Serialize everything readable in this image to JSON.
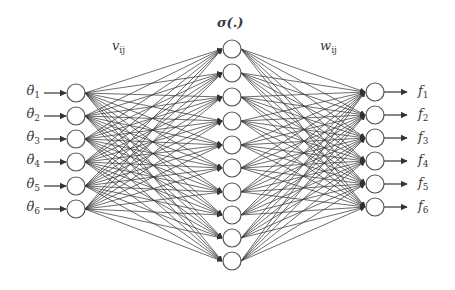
{
  "diagram": {
    "type": "feedforward-neural-network",
    "colors": {
      "line": "#333333",
      "node_stroke": "#555555",
      "node_fill": "#ffffff",
      "text": "#3a3a3a"
    },
    "activation_label": "σ(.)",
    "weights": {
      "input_hidden": {
        "symbol": "v",
        "subscript": "ij"
      },
      "hidden_output": {
        "symbol": "w",
        "subscript": "ij"
      }
    },
    "layers": {
      "input": {
        "x": 76,
        "radius": 9,
        "ys": [
          93,
          116,
          139,
          162,
          186,
          209
        ],
        "labels": [
          {
            "symbol": "θ̈",
            "subscript": "1"
          },
          {
            "symbol": "θ̈",
            "subscript": "2"
          },
          {
            "symbol": "θ̈",
            "subscript": "3"
          },
          {
            "symbol": "θ̈",
            "subscript": "4"
          },
          {
            "symbol": "θ̈",
            "subscript": "5"
          },
          {
            "symbol": "θ̈",
            "subscript": "6"
          }
        ]
      },
      "hidden": {
        "x": 232,
        "radius": 9,
        "ys": [
          49,
          73,
          97,
          121,
          145,
          168,
          192,
          215,
          238,
          261
        ]
      },
      "output": {
        "x": 375,
        "radius": 9,
        "ys": [
          92,
          115,
          138,
          161,
          184,
          207
        ],
        "labels": [
          {
            "symbol": "f",
            "subscript": "1"
          },
          {
            "symbol": "f",
            "subscript": "2"
          },
          {
            "symbol": "f",
            "subscript": "3"
          },
          {
            "symbol": "f",
            "subscript": "4"
          },
          {
            "symbol": "f",
            "subscript": "5"
          },
          {
            "symbol": "f",
            "subscript": "6"
          }
        ]
      }
    }
  }
}
